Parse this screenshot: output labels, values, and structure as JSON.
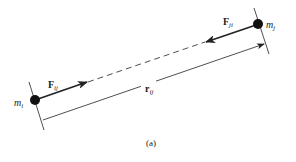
{
  "diagram": {
    "masses": [
      {
        "id": "m_i",
        "label": "m",
        "subscript": "i"
      },
      {
        "id": "m_j",
        "label": "m",
        "subscript": "j"
      }
    ],
    "forces": [
      {
        "id": "F_ij",
        "label": "F",
        "subscript": "ij"
      },
      {
        "id": "F_ji",
        "label": "F",
        "subscript": "ji"
      }
    ],
    "separation": {
      "label": "r",
      "subscript": "ij"
    },
    "caption": "(a)",
    "colors": {
      "stroke": "#222222",
      "background": "#ffffff"
    }
  }
}
